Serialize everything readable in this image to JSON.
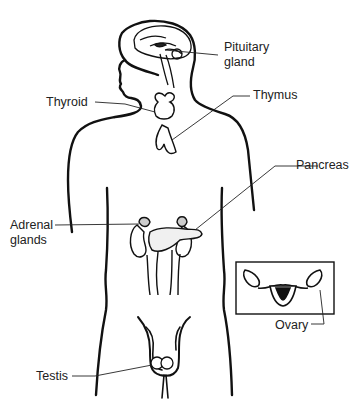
{
  "diagram": {
    "labels": {
      "pituitary": "Pituitary",
      "pituitary_2": "gland",
      "thyroid": "Thyroid",
      "thymus": "Thymus",
      "pancreas": "Pancreas",
      "adrenal": "Adrenal",
      "adrenal_2": "glands",
      "ovary": "Ovary",
      "testis": "Testis"
    },
    "inset": "female-reproductive-organs"
  }
}
